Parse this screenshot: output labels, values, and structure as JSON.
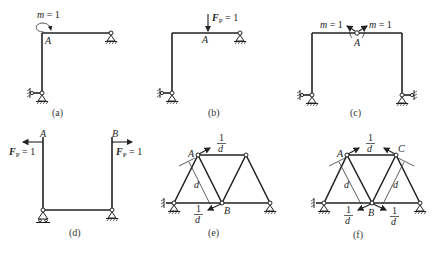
{
  "figure": {
    "panels": [
      {
        "id": "a",
        "caption": "(a)",
        "load_label": "m = 1",
        "m_var": "m",
        "eq": " = 1",
        "point": "A"
      },
      {
        "id": "b",
        "caption": "(b)",
        "load_label": "F_P = 1",
        "f_var": "F",
        "f_sub": "P",
        "eq": " = 1",
        "point": "A"
      },
      {
        "id": "c",
        "caption": "(c)",
        "left_load": "m = 1",
        "right_load": "m = 1",
        "m_var": "m",
        "eq": " = 1",
        "point": "A"
      },
      {
        "id": "d",
        "caption": "(d)",
        "left_point": "A",
        "right_point": "B",
        "f_var": "F",
        "f_sub": "P",
        "eq": " = 1"
      },
      {
        "id": "e",
        "caption": "(e)",
        "point_a": "A",
        "point_b": "B",
        "frac_num": "1",
        "frac_den": "d",
        "dist": "d"
      },
      {
        "id": "f",
        "caption": "(f)",
        "point_a": "A",
        "point_b": "B",
        "point_c": "C",
        "frac_num": "1",
        "frac_den": "d",
        "dist": "d"
      }
    ]
  }
}
